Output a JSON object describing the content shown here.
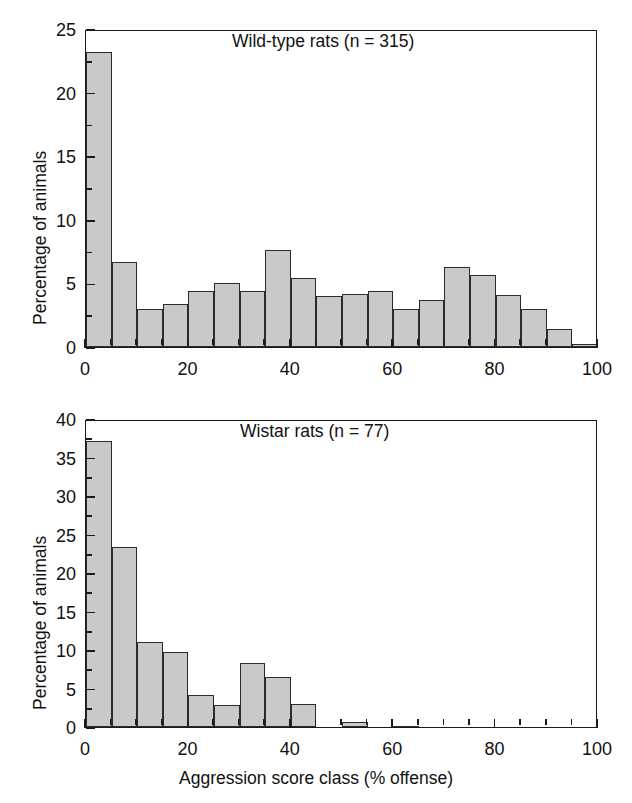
{
  "figure": {
    "xlabel": "Aggression score class (% offense)",
    "ylabel": "Percentage of animals"
  },
  "chart_data": [
    {
      "type": "bar",
      "title": "Wild-type rats (n = 315)",
      "xlabel": "Aggression score class (% offense)",
      "ylabel": "Percentage of animals",
      "xlim": [
        0,
        100
      ],
      "ylim": [
        0,
        25
      ],
      "xticks": [
        0,
        20,
        40,
        60,
        80,
        100
      ],
      "xtick_labels": [
        "0",
        "20",
        "40",
        "60",
        "80",
        "100"
      ],
      "yticks": [
        0,
        5,
        10,
        15,
        20,
        25
      ],
      "ytick_labels": [
        "0",
        "5",
        "10",
        "15",
        "20",
        "25"
      ],
      "xminor_step": 5,
      "yminor_step": 2.5,
      "grid": false,
      "legend": false,
      "bin_width": 5,
      "bin_starts": [
        0,
        5,
        10,
        15,
        20,
        25,
        30,
        35,
        40,
        45,
        50,
        55,
        60,
        65,
        70,
        75,
        80,
        85,
        90,
        95
      ],
      "bin_labels": [
        "0-5",
        "5-10",
        "10-15",
        "15-20",
        "20-25",
        "25-30",
        "30-35",
        "35-40",
        "40-45",
        "45-50",
        "50-55",
        "55-60",
        "60-65",
        "65-70",
        "70-75",
        "75-80",
        "80-85",
        "85-90",
        "90-95",
        "95-100"
      ],
      "values": [
        23.2,
        6.7,
        3.0,
        3.4,
        4.4,
        5.0,
        4.4,
        7.6,
        5.4,
        4.0,
        4.2,
        4.4,
        3.0,
        3.7,
        6.3,
        5.7,
        4.1,
        3.0,
        1.4,
        0.2
      ]
    },
    {
      "type": "bar",
      "title": "Wistar rats (n = 77)",
      "xlabel": "Aggression score class (% offense)",
      "ylabel": "Percentage of animals",
      "xlim": [
        0,
        100
      ],
      "ylim": [
        0,
        40
      ],
      "xticks": [
        0,
        20,
        40,
        60,
        80,
        100
      ],
      "xtick_labels": [
        "0",
        "20",
        "40",
        "60",
        "80",
        "100"
      ],
      "yticks": [
        0,
        5,
        10,
        15,
        20,
        25,
        30,
        35,
        40
      ],
      "ytick_labels": [
        "0",
        "5",
        "10",
        "15",
        "20",
        "25",
        "30",
        "35",
        "40"
      ],
      "xminor_step": 5,
      "yminor_step": 2.5,
      "grid": false,
      "legend": false,
      "bin_width": 5,
      "bin_starts": [
        0,
        5,
        10,
        15,
        20,
        25,
        30,
        35,
        40,
        45,
        50,
        55,
        60,
        65,
        70,
        75,
        80,
        85,
        90,
        95
      ],
      "bin_labels": [
        "0-5",
        "5-10",
        "10-15",
        "15-20",
        "20-25",
        "25-30",
        "30-35",
        "35-40",
        "40-45",
        "45-50",
        "50-55",
        "55-60",
        "60-65",
        "65-70",
        "70-75",
        "75-80",
        "80-85",
        "85-90",
        "90-95",
        "95-100"
      ],
      "values": [
        37.1,
        23.4,
        11.0,
        9.7,
        4.2,
        2.8,
        8.3,
        6.5,
        3.0,
        0.0,
        0.6,
        0.0,
        0.1,
        0.0,
        0.0,
        0.0,
        0.0,
        0.0,
        0.0,
        0.0
      ]
    }
  ],
  "colors": {
    "bar_fill": "#c9c9c9",
    "bar_stroke": "#2b2b2b",
    "axis": "#1a1a1a",
    "text": "#111111",
    "background": "#ffffff"
  }
}
